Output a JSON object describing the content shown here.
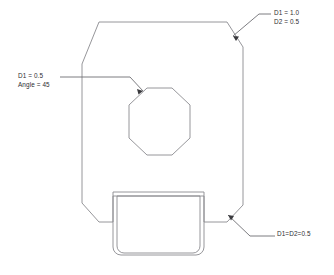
{
  "drawing": {
    "title": "Chamfer and fillet dimension callouts",
    "background_color": "#ffffff",
    "line_color": "#8a8a8f",
    "leader_color": "#6e6e73",
    "text_color": "#2e2e32"
  },
  "annotations": {
    "top_right": {
      "name": "top-right-chamfer-callout",
      "line1": "D1 = 1.0",
      "line2": "D2 = 0.5"
    },
    "left": {
      "name": "octagon-chamfer-callout",
      "line1": "D1 = 0.5",
      "line2": "Angle = 45"
    },
    "bottom_right": {
      "name": "bottom-right-chamfer-callout",
      "line1": "D1=D2=0.5"
    }
  },
  "geometry": {
    "main_body": {
      "name": "chamfered-plate-outline",
      "points": "82,64 99,22 227,22 243,47 243,205 227,222 204,222 204,196 113,196 113,222 99,222 82,203"
    },
    "octagon_hole": {
      "name": "octagonal-hole",
      "points": "147,88 172,88 190,105 190,138 172,155 147,155 129,138 129,105"
    },
    "tab_outer": {
      "name": "tab-outer-outline",
      "path": "M 113,192 L 204,192 L 204,247 A 8 8 0 0 1 196,255 L 121,255 A 8 8 0 0 1 113,247 Z"
    },
    "tab_inner": {
      "name": "tab-inner-outline",
      "path": "M 117,196 L 200,196 L 200,246 A 7 7 0 0 1 193,253 L 124,253 A 7 7 0 0 1 117,246 Z"
    },
    "leaders": [
      {
        "name": "top-right-leader-line",
        "path": "M 271,14 L 259,14 L 233,36"
      },
      {
        "name": "left-leader-line",
        "path": "M 60,77 L 130,77 L 143,91"
      },
      {
        "name": "bottom-right-leader-line",
        "path": "M 275,236 L 250,236 L 228,215"
      }
    ]
  }
}
